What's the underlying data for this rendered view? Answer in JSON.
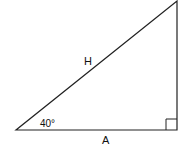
{
  "diagram": {
    "type": "right-triangle",
    "labels": {
      "hypotenuse": "H",
      "adjacent": "A",
      "angle": "40°"
    },
    "colors": {
      "stroke": "#222222",
      "background": "#ffffff"
    }
  }
}
